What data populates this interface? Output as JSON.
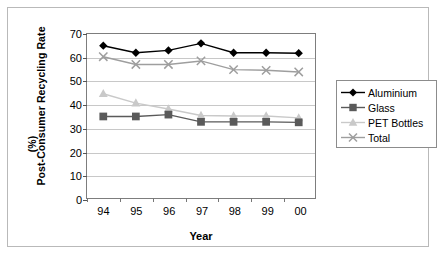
{
  "chart_data": {
    "type": "line",
    "title": "",
    "xlabel": "Year",
    "ylabel": "Post-Consumer Recycling Rate",
    "ylabel_unit": "(%)",
    "categories": [
      "94",
      "95",
      "96",
      "97",
      "98",
      "99",
      "00"
    ],
    "x": [
      94,
      95,
      96,
      97,
      98,
      99,
      0
    ],
    "ylim": [
      0,
      70
    ],
    "yticks": [
      0,
      10,
      20,
      30,
      40,
      50,
      60,
      70
    ],
    "grid": true,
    "legend_position": "right",
    "series": [
      {
        "name": "Aluminium",
        "marker": "diamond",
        "color": "#000000",
        "values": [
          65.0,
          62.0,
          63.0,
          66.0,
          62.0,
          62.0,
          61.8
        ]
      },
      {
        "name": "Glass",
        "marker": "square",
        "color": "#5a5a5a",
        "values": [
          34.8,
          34.8,
          35.6,
          32.5,
          32.5,
          32.5,
          32.3
        ]
      },
      {
        "name": "PET Bottles",
        "marker": "triangle",
        "color": "#c9c9c9",
        "values": [
          44.5,
          40.5,
          38.0,
          35.2,
          35.0,
          35.0,
          34.2
        ]
      },
      {
        "name": "Total",
        "marker": "cross",
        "color": "#9e9e9e",
        "values": [
          60.3,
          57.0,
          57.0,
          58.5,
          54.8,
          54.5,
          53.8
        ]
      }
    ]
  },
  "legend": {
    "entries": [
      {
        "label": "Aluminium"
      },
      {
        "label": "Glass"
      },
      {
        "label": "PET Bottles"
      },
      {
        "label": "Total"
      }
    ]
  }
}
